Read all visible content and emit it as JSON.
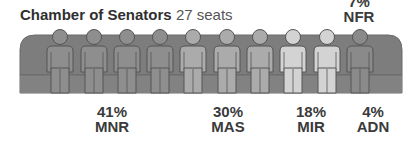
{
  "title": {
    "main": "Chamber of Senators",
    "sub": "27 seats"
  },
  "labels": [
    {
      "pct": "41%",
      "party": "MNR"
    },
    {
      "pct": "30%",
      "party": "MAS"
    },
    {
      "pct": "18%",
      "party": "MIR"
    },
    {
      "pct": "4%",
      "party": "ADN"
    },
    {
      "pct": "7%",
      "party": "NFR"
    }
  ],
  "colors": {
    "bench": "#7d7d7d",
    "bench_outline": "#5f5f5f",
    "MNR": "#8e8e8e",
    "MAS": "#ababab",
    "MIR": "#d3d3d3",
    "NFR": "#8a8a8a",
    "outline": "#555555"
  },
  "chart_data": {
    "type": "pictogram",
    "title": "Chamber of Senators",
    "subtitle": "27 seats",
    "total_seats": 27,
    "categories": [
      "MNR",
      "MAS",
      "MIR",
      "ADN",
      "NFR"
    ],
    "values": [
      41,
      30,
      18,
      4,
      7
    ],
    "unit": "%",
    "figures": [
      {
        "party": "MNR",
        "count": 4
      },
      {
        "party": "MAS",
        "count": 3
      },
      {
        "party": "MIR",
        "count": 2
      },
      {
        "party": "NFR",
        "count": 1
      }
    ]
  }
}
